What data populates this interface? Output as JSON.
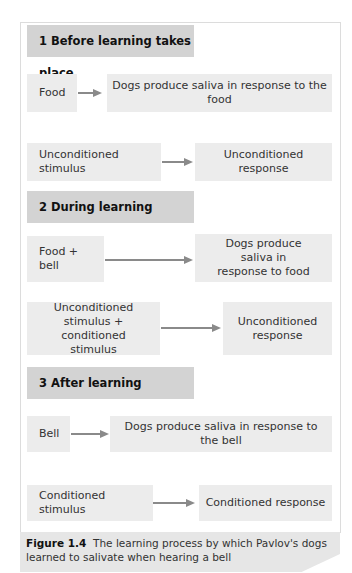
{
  "sections": [
    {
      "title": "1 Before learning takes place",
      "rows": [
        {
          "left": "Food",
          "right": "Dogs produce saliva in response to the food"
        },
        {
          "left": "Unconditioned stimulus",
          "right": "Unconditioned response"
        }
      ]
    },
    {
      "title": "2 During learning",
      "rows": [
        {
          "left": "Food + bell",
          "right": "Dogs produce saliva in response to food"
        },
        {
          "left": "Unconditioned stimulus + conditioned stimulus",
          "right": "Unconditioned response"
        }
      ]
    },
    {
      "title": "3 After learning",
      "rows": [
        {
          "left": "Bell",
          "right": "Dogs produce saliva in response to the bell"
        },
        {
          "left": "Conditioned stimulus",
          "right": "Conditioned response"
        }
      ]
    }
  ],
  "caption": {
    "label": "Figure 1.4",
    "text": "The learning process by which Pavlov's dogs learned to salivate when hearing a bell"
  }
}
